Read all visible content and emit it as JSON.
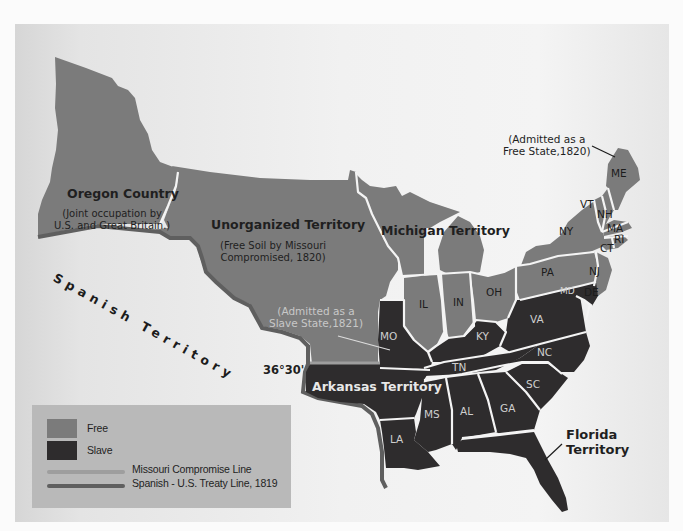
{
  "map": {
    "colors": {
      "free": "#7b7b7b",
      "slave": "#2e2c2d",
      "missouri_compromise_line": "#9e9e9e",
      "treaty_line": "#5f5f5f",
      "background": "#f1f1f1",
      "legend_bg": "#b9b9b9"
    },
    "regions": {
      "oregon": {
        "title": "Oregon Country",
        "subtitle_line1": "(Joint occupation by",
        "subtitle_line2": "U.S. and Great Britain.)"
      },
      "unorganized": {
        "title": "Unorganized Territory",
        "subtitle_line1": "(Free Soil by Missouri",
        "subtitle_line2": "Compromised, 1820)"
      },
      "michigan": {
        "title": "Michigan Territory"
      },
      "arkansas": {
        "title": "Arkansas Territory"
      },
      "florida": {
        "title_line1": "Florida",
        "title_line2": "Territory"
      },
      "spanish": {
        "title": "Spanish Territory"
      }
    },
    "annotations": {
      "maine_note_line1": "(Admitted as a",
      "maine_note_line2": "Free State,1820)",
      "missouri_note_line1": "(Admitted as a",
      "missouri_note_line2": "Slave State,1821)",
      "latitude": "36°30'"
    },
    "states": {
      "free": [
        "ME",
        "VT",
        "NH",
        "MA",
        "RI",
        "CT",
        "NY",
        "NJ",
        "PA",
        "OH",
        "IN",
        "IL"
      ],
      "slave": [
        "MD",
        "DE",
        "VA",
        "KY",
        "MO",
        "NC",
        "TN",
        "SC",
        "GA",
        "AL",
        "MS",
        "LA"
      ],
      "labels": {
        "ME": "ME",
        "VT": "VT",
        "NH": "NH",
        "MA": "MA",
        "RI": "RI",
        "CT": "CT",
        "NY": "NY",
        "NJ": "NJ",
        "PA": "PA",
        "MD": "MD",
        "DE": "DE",
        "OH": "OH",
        "IN": "IN",
        "IL": "IL",
        "MO": "MO",
        "KY": "KY",
        "VA": "VA",
        "NC": "NC",
        "TN": "TN",
        "SC": "SC",
        "GA": "GA",
        "AL": "AL",
        "MS": "MS",
        "LA": "LA"
      }
    }
  },
  "legend": {
    "items": [
      {
        "label": "Free",
        "type": "swatch"
      },
      {
        "label": "Slave",
        "type": "swatch"
      },
      {
        "label": "Missouri Compromise Line",
        "type": "line"
      },
      {
        "label": "Spanish - U.S. Treaty Line, 1819",
        "type": "line"
      }
    ]
  }
}
